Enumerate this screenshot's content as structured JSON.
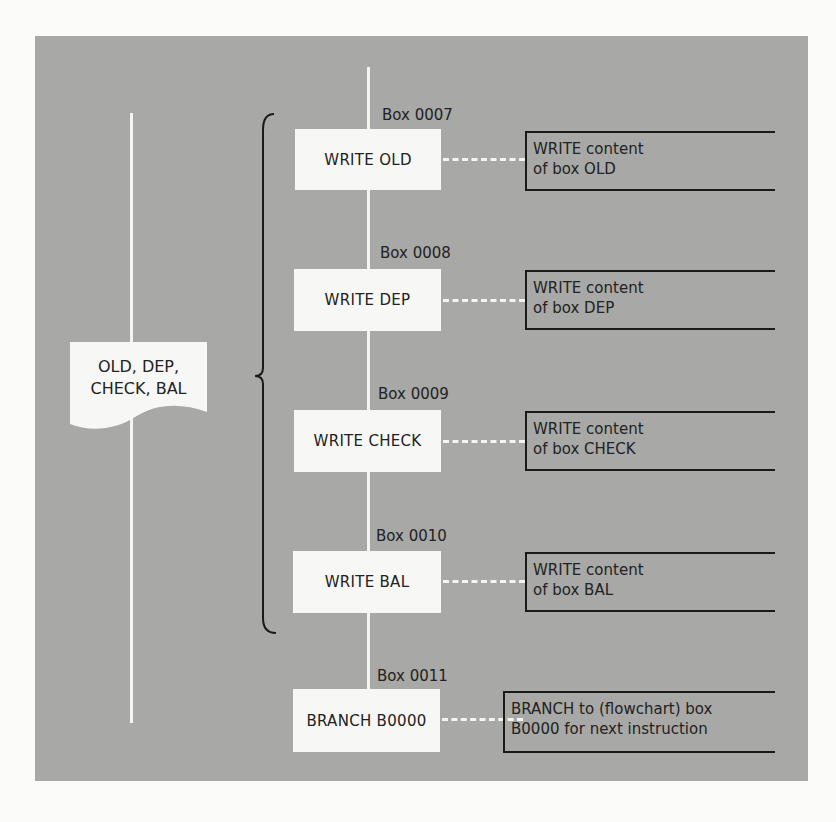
{
  "diagram": {
    "io_symbol": {
      "line1": "OLD, DEP,",
      "line2": "CHECK, BAL"
    },
    "steps": [
      {
        "box_label": "Box 0007",
        "instruction": "WRITE OLD",
        "note_line1": "WRITE content",
        "note_line2": "of box OLD"
      },
      {
        "box_label": "Box 0008",
        "instruction": "WRITE DEP",
        "note_line1": "WRITE content",
        "note_line2": "of box DEP"
      },
      {
        "box_label": "Box 0009",
        "instruction": "WRITE CHECK",
        "note_line1": "WRITE content",
        "note_line2": "of box CHECK"
      },
      {
        "box_label": "Box 0010",
        "instruction": "WRITE BAL",
        "note_line1": "WRITE content",
        "note_line2": "of box BAL"
      },
      {
        "box_label": "Box 0011",
        "instruction": "BRANCH B0000",
        "note_line1": "BRANCH to (flowchart) box",
        "note_line2": "B0000 for next instruction"
      }
    ],
    "colors": {
      "panel": "#a8a8a6",
      "box": "#f7f7f5",
      "line": "#f4f4f2",
      "ink": "#1a1a1a"
    }
  }
}
